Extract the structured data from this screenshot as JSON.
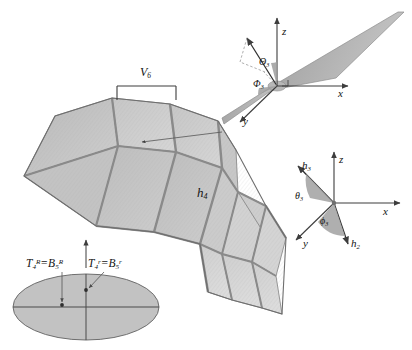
{
  "figure": {
    "type": "3d-technical-diagram",
    "background": "#ffffff",
    "colors": {
      "surface_light": "#c9c9c9",
      "surface_mid": "#b4b4b4",
      "surface_dark": "#9a9a9a",
      "ridge": "#7d7d7d",
      "outline": "#6e6e6e",
      "axis": "#4a4a4a",
      "leader": "#595959",
      "text": "#141414",
      "ellipse_fill": "#c2c2c2",
      "angle_wedge": "#a6a6a6"
    }
  },
  "main_surface": {
    "label": "h4",
    "label_base": "h",
    "label_sub": "4",
    "panel_count_visible": 12
  },
  "span_bracket": {
    "label_base": "V",
    "label_sub": "6"
  },
  "top_inset": {
    "name": "blade-coordinate-frame",
    "axes": [
      {
        "name": "z-axis",
        "label": "z"
      },
      {
        "name": "x-axis",
        "label": "x"
      },
      {
        "name": "y-axis",
        "label": "y"
      }
    ],
    "angles": [
      {
        "name": "theta-angle",
        "base": "Θ",
        "sub": "3"
      },
      {
        "name": "phi-angle",
        "base": "Φ",
        "sub": "3"
      }
    ]
  },
  "bottom_inset": {
    "name": "local-vector-frame",
    "axes": [
      {
        "name": "z-axis",
        "label": "z"
      },
      {
        "name": "x-axis",
        "label": "x"
      },
      {
        "name": "y-axis",
        "label": "y"
      }
    ],
    "vectors": [
      {
        "name": "h3-vector",
        "base": "h",
        "sub": "3"
      },
      {
        "name": "h2-vector",
        "base": "h",
        "sub": "2"
      }
    ],
    "angles": [
      {
        "name": "theta3-angle",
        "base": "θ",
        "sub": "3"
      },
      {
        "name": "phi3-angle",
        "base": "ϕ",
        "sub": "3"
      }
    ]
  },
  "cross_section": {
    "name": "elliptical-cross-section",
    "equations": [
      {
        "name": "equation-left",
        "lhs_base": "T",
        "lhs_sub": "4",
        "lhs_sup": "R",
        "operator": "=",
        "rhs_base": "B",
        "rhs_sub": "5",
        "rhs_sup": "R"
      },
      {
        "name": "equation-right",
        "lhs_base": "T",
        "lhs_sub": "4",
        "lhs_sup": "r",
        "operator": "=",
        "rhs_base": "B",
        "rhs_sub": "5",
        "rhs_sup": "r"
      }
    ]
  }
}
